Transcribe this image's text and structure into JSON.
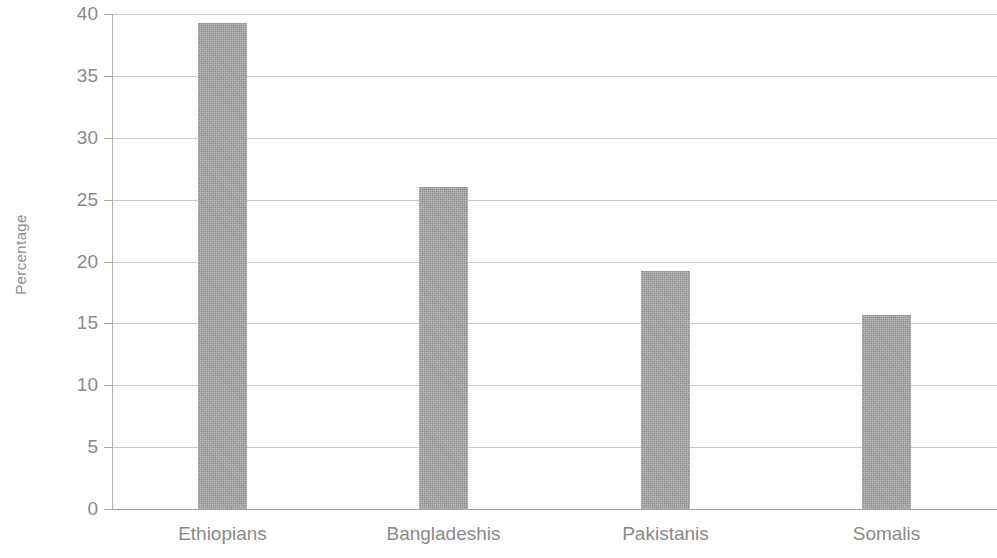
{
  "chart_data": {
    "type": "bar",
    "title": "",
    "subtitle": "",
    "xlabel": "",
    "ylabel": "Percentage",
    "categories": [
      "Ethiopians",
      "Bangladeshis",
      "Pakistanis",
      "Somalis"
    ],
    "values": [
      39.3,
      26.0,
      19.2,
      15.7
    ],
    "series": [
      {
        "name": "Percentage",
        "values": [
          39.3,
          26.0,
          19.2,
          15.7
        ]
      }
    ],
    "ylim": [
      0,
      40
    ],
    "ytick_step": 5,
    "ytick_labels": [
      "0",
      "5",
      "10",
      "15",
      "20",
      "25",
      "30",
      "35",
      "40"
    ],
    "ytick_values": [
      0,
      5,
      10,
      15,
      20,
      25,
      30,
      35,
      40
    ],
    "grid": true,
    "grid_axis": "y",
    "legend": false,
    "legend_position": "none",
    "annotations": [],
    "colors": {
      "bar_fill": "#a0a0a0",
      "gridline": "#c9c9c9",
      "axis_line": "#b0b0b0",
      "baseline": "#9e9e9e",
      "text": "#8a8a8a",
      "background": "#ffffff"
    }
  }
}
